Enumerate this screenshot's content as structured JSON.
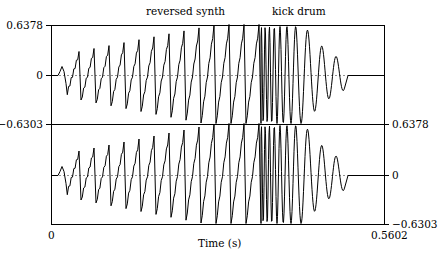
{
  "chart_data": {
    "type": "line",
    "title": "",
    "annotations": [
      "reversed synth",
      "kick drum"
    ],
    "xlabel": "Time (s)",
    "x_ticks": [
      "0",
      "0.5602"
    ],
    "xlim": [
      0,
      0.5602
    ],
    "channels": [
      {
        "name": "channel 1",
        "ylim": [
          -0.6303,
          0.6378
        ],
        "y_ticks": [
          "0.6378",
          "0",
          "-0.6303"
        ],
        "axis_side": "left"
      },
      {
        "name": "channel 2",
        "ylim": [
          -0.6303,
          0.6378
        ],
        "y_ticks": [
          "0.6378",
          "0",
          "-0.6303"
        ],
        "axis_side": "right"
      }
    ],
    "segments": [
      {
        "label": "reversed synth",
        "t_start": 0.0,
        "t_end": 0.36,
        "shape": "sawtooth, amplitude ramping up"
      },
      {
        "label": "kick drum",
        "t_start": 0.36,
        "t_end": 0.5,
        "shape": "sine sweep, decreasing frequency, decaying"
      }
    ],
    "grid": false,
    "zero_line": "dotted"
  },
  "labels": {
    "top_annotation_1": "reversed synth",
    "top_annotation_2": "kick drum",
    "ch1_ymax": "0.6378",
    "ch1_zero": "0",
    "ch1_ymin": "−0.6303",
    "ch2_ymax": "0.6378",
    "ch2_zero": "0",
    "ch2_ymin": "−0.6303",
    "x_min": "0",
    "x_max": "0.5602",
    "x_label": "Time (s)"
  }
}
